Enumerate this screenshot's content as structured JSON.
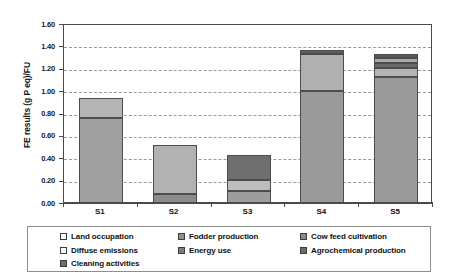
{
  "chart_data": {
    "type": "bar",
    "subtype": "stacked-bar",
    "title": "",
    "xlabel": "",
    "ylabel": "FE results (g P eq)/FU",
    "categories": [
      "S1",
      "S2",
      "S3",
      "S4",
      "S5"
    ],
    "ylim": [
      0.0,
      1.6
    ],
    "yticks": [
      "0.00",
      "0.20",
      "0.40",
      "0.60",
      "0.80",
      "1.00",
      "1.20",
      "1.40",
      "1.60"
    ],
    "ytick_values": [
      0.0,
      0.2,
      0.4,
      0.6,
      0.8,
      1.0,
      1.2,
      1.4,
      1.6
    ],
    "grid": true,
    "grid_style": "dashed-horizontal",
    "legend_position": "bottom",
    "series": [
      {
        "name": "Land occupation",
        "color": "#ffffff",
        "values": [
          0.0,
          0.0,
          0.0,
          0.0,
          0.0
        ]
      },
      {
        "name": "Fodder production",
        "color": "#a0a0a0",
        "values": [
          0.76,
          0.0,
          0.0,
          0.0,
          0.0
        ]
      },
      {
        "name": "Cow feed cultivation",
        "color": "#9a9a9a",
        "values": [
          0.0,
          0.0,
          0.0,
          1.0,
          1.13
        ]
      },
      {
        "name": "Diffuse emissions",
        "color": "#fafafa",
        "values": [
          0.0,
          0.0,
          0.0,
          0.0,
          0.0
        ]
      },
      {
        "name": "Energy use",
        "color": "#b4b4b4",
        "values": [
          0.18,
          0.44,
          0.1,
          0.33,
          0.08
        ]
      },
      {
        "name": "Agrochemical production",
        "color": "#6f6f6f",
        "values": [
          0.0,
          0.0,
          0.22,
          0.04,
          0.04
        ]
      },
      {
        "name": "Cleaning activities",
        "color": "#8c8c8c",
        "values": [
          0.0,
          0.08,
          0.11,
          0.0,
          0.08
        ]
      }
    ],
    "totals": [
      0.94,
      0.52,
      0.43,
      1.37,
      1.33
    ],
    "stacks": [
      {
        "category": "S1",
        "total": 0.94,
        "segments": [
          {
            "label": "Fodder production",
            "value": 0.76,
            "color": "#a0a0a0"
          },
          {
            "label": "Energy use",
            "value": 0.18,
            "color": "#b4b4b4"
          }
        ]
      },
      {
        "category": "S2",
        "total": 0.52,
        "segments": [
          {
            "label": "Cleaning activities",
            "value": 0.08,
            "color": "#8c8c8c"
          },
          {
            "label": "Energy use",
            "value": 0.44,
            "color": "#b2b2b2"
          }
        ]
      },
      {
        "category": "S3",
        "total": 0.43,
        "segments": [
          {
            "label": "Cleaning activities",
            "value": 0.11,
            "color": "#9d9d9d"
          },
          {
            "label": "Energy use",
            "value": 0.1,
            "color": "#bdbdbd"
          },
          {
            "label": "Agrochemical production",
            "value": 0.22,
            "color": "#6f6f6f"
          }
        ]
      },
      {
        "category": "S4",
        "total": 1.37,
        "segments": [
          {
            "label": "Cow feed cultivation",
            "value": 1.0,
            "color": "#9a9a9a"
          },
          {
            "label": "Energy use",
            "value": 0.33,
            "color": "#b0b0b0"
          },
          {
            "label": "Agrochemical production",
            "value": 0.04,
            "color": "#5e5e5e"
          }
        ]
      },
      {
        "category": "S5",
        "total": 1.33,
        "segments": [
          {
            "label": "Cow feed cultivation",
            "value": 1.13,
            "color": "#9a9a9a"
          },
          {
            "label": "Energy use",
            "value": 0.08,
            "color": "#b4b4b4"
          },
          {
            "label": "Agrochemical production",
            "value": 0.04,
            "color": "#6a6a6a"
          },
          {
            "label": "Cleaning activities",
            "value": 0.05,
            "color": "#a8a8a8"
          },
          {
            "label": "Land occupation",
            "value": 0.03,
            "color": "#5a5a5a"
          }
        ]
      }
    ]
  },
  "legend": {
    "columns": [
      {
        "items": [
          {
            "label": "Land occupation",
            "color": "#fcfcfc"
          },
          {
            "label": "Diffuse emissions",
            "color": "#fcfcfc"
          },
          {
            "label": "Cleaning activities",
            "color": "#6e6e6e"
          }
        ]
      },
      {
        "items": [
          {
            "label": "Fodder production",
            "color": "#8f8f8f"
          },
          {
            "label": "Energy use",
            "color": "#7e7e7e"
          }
        ]
      },
      {
        "items": [
          {
            "label": "Cow feed cultivation",
            "color": "#8a8a8a"
          },
          {
            "label": "Agrochemical production",
            "color": "#6a6a6a"
          }
        ]
      }
    ]
  },
  "colors": {
    "axis": "#4a4a4a",
    "grid": "#9a9a9a",
    "text": "#111111",
    "plot_background": "#ffffff",
    "legend_border": "#8e8e8e"
  }
}
